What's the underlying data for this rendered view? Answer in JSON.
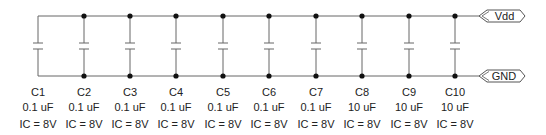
{
  "diagram": {
    "type": "schematic",
    "rails": {
      "top": {
        "label": "Vdd",
        "y": 16
      },
      "bottom": {
        "label": "GND",
        "y": 76
      }
    },
    "capacitors": [
      {
        "name": "C1",
        "value": "0.1 uF",
        "ic": "IC = 8V",
        "x": 38
      },
      {
        "name": "C2",
        "value": "0.1 uF",
        "ic": "IC = 8V",
        "x": 84
      },
      {
        "name": "C3",
        "value": "0.1 uF",
        "ic": "IC = 8V",
        "x": 130
      },
      {
        "name": "C4",
        "value": "0.1 uF",
        "ic": "IC = 8V",
        "x": 176
      },
      {
        "name": "C5",
        "value": "0.1 uF",
        "ic": "IC = 8V",
        "x": 223
      },
      {
        "name": "C6",
        "value": "0.1 uF",
        "ic": "IC = 8V",
        "x": 269
      },
      {
        "name": "C7",
        "value": "0.1 uF",
        "ic": "IC = 8V",
        "x": 316
      },
      {
        "name": "C8",
        "value": "10 uF",
        "ic": "IC = 8V",
        "x": 362
      },
      {
        "name": "C9",
        "value": "10 uF",
        "ic": "IC = 8V",
        "x": 409
      },
      {
        "name": "C10",
        "value": "10 uF",
        "ic": "IC = 8V",
        "x": 455
      }
    ],
    "colors": {
      "wire": "#666666",
      "node": "#111111",
      "text": "#222222"
    }
  }
}
